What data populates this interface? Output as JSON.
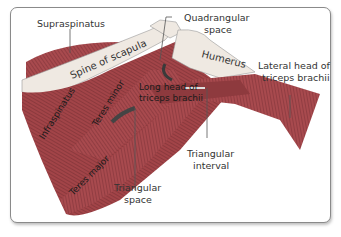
{
  "labels": {
    "supraspinatus": "Supraspinatus",
    "spine_of_scapula": "Spine of scapula",
    "quadrangular_space_1": "Quadrangular",
    "quadrangular_space_2": "space",
    "humerus": "Humerus",
    "lateral_head_1": "Lateral head of",
    "lateral_head_2": "triceps brachii",
    "long_head_1": "Long head of",
    "long_head_2": "triceps brachii",
    "infraspinatus": "Infraspinatus",
    "teres_minor": "Teres minor",
    "teres_major": "Teres major",
    "triangular_interval_1": "Triangular",
    "triangular_interval_2": "interval",
    "triangular_space_1": "Triangular",
    "triangular_space_2": "space"
  },
  "colors": {
    "muscle": "#a84a4e",
    "muscle_dark": "#7e3034",
    "bone": "#efe9e2",
    "frame": "#8a8a8a",
    "leader": "#555555"
  }
}
